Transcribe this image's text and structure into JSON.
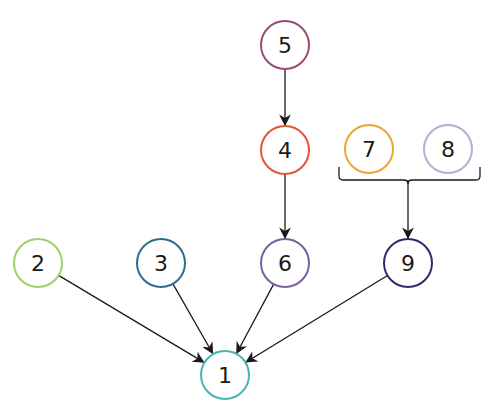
{
  "diagram": {
    "type": "dependency-graph",
    "nodes": [
      {
        "id": "1",
        "label": "1",
        "cx": 225,
        "cy": 375,
        "color": "#4bb3b0"
      },
      {
        "id": "2",
        "label": "2",
        "cx": 38,
        "cy": 263,
        "color": "#9fcf6a"
      },
      {
        "id": "3",
        "label": "3",
        "cx": 161,
        "cy": 263,
        "color": "#2f6a8f"
      },
      {
        "id": "4",
        "label": "4",
        "cx": 285,
        "cy": 150,
        "color": "#e2553a"
      },
      {
        "id": "5",
        "label": "5",
        "cx": 285,
        "cy": 45,
        "color": "#9b4a78"
      },
      {
        "id": "6",
        "label": "6",
        "cx": 285,
        "cy": 263,
        "color": "#7a609a"
      },
      {
        "id": "7",
        "label": "7",
        "cx": 369,
        "cy": 149,
        "color": "#f0a232"
      },
      {
        "id": "8",
        "label": "8",
        "cx": 448,
        "cy": 149,
        "color": "#aab4d2"
      },
      {
        "id": "9",
        "label": "9",
        "cx": 408,
        "cy": 263,
        "color": "#2e2a6e"
      }
    ],
    "edges": [
      {
        "from": "5",
        "to": "4"
      },
      {
        "from": "4",
        "to": "6"
      },
      {
        "from": "2",
        "to": "1"
      },
      {
        "from": "3",
        "to": "1"
      },
      {
        "from": "6",
        "to": "1"
      },
      {
        "from": "9",
        "to": "1"
      },
      {
        "from": "7+8",
        "to": "9",
        "via": "bracket"
      }
    ],
    "bracket": {
      "groups": [
        "7",
        "8"
      ],
      "x1": 339,
      "x2": 480,
      "y_top": 167,
      "y_bar": 180,
      "mid_x": 408
    },
    "node_radius": 24,
    "edge_color": "#1a1a1a"
  }
}
